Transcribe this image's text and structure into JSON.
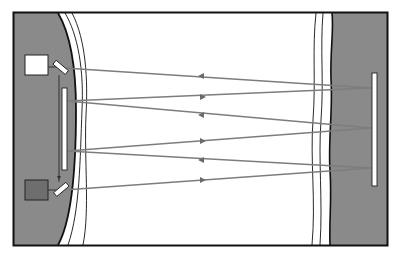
{
  "diagram": {
    "type": "multipass-optical-cell",
    "colors": {
      "background": "#ffffff",
      "frame": "#111111",
      "wall": "#8a8a8a",
      "ray": "#7d7d7d",
      "mirror_fill": "#ffffff",
      "detector_fill": "#6e6e6e",
      "source_fill": "#ffffff"
    },
    "components": {
      "source_box": {
        "x": 25,
        "y": 55,
        "w": 23,
        "h": 20
      },
      "detector_box": {
        "x": 25,
        "y": 180,
        "w": 23,
        "h": 20
      },
      "top_splitter": {
        "cx": 60,
        "cy": 68
      },
      "bottom_splitter": {
        "cx": 60,
        "cy": 190
      },
      "left_mirror": {
        "x": 61,
        "y": 88,
        "w": 6,
        "h": 82
      },
      "right_mirror": {
        "x": 371,
        "y": 73,
        "w": 6,
        "h": 113
      }
    },
    "rays": [
      {
        "from": [
          64,
          68
        ],
        "to": [
          371,
          88
        ],
        "direction": "left"
      },
      {
        "from": [
          67,
          101
        ],
        "to": [
          371,
          88
        ],
        "direction": "right"
      },
      {
        "from": [
          67,
          101
        ],
        "to": [
          371,
          128
        ],
        "direction": "left"
      },
      {
        "from": [
          67,
          151
        ],
        "to": [
          371,
          128
        ],
        "direction": "right"
      },
      {
        "from": [
          67,
          151
        ],
        "to": [
          371,
          168
        ],
        "direction": "left"
      },
      {
        "from": [
          64,
          190
        ],
        "to": [
          371,
          168
        ],
        "direction": "right"
      }
    ]
  }
}
